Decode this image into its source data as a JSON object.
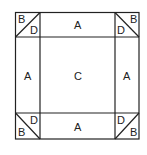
{
  "diagram": {
    "regions": {
      "top_left_corner": {
        "upper": "B",
        "lower": "D"
      },
      "top_edge": "A",
      "top_right_corner": {
        "upper": "B",
        "lower": "D"
      },
      "left_edge": "A",
      "center": "C",
      "right_edge": "A",
      "bottom_left_corner": {
        "upper": "D",
        "lower": "B"
      },
      "bottom_edge": "A",
      "bottom_right_corner": {
        "upper": "D",
        "lower": "B"
      }
    },
    "stroke_color": "#222222"
  }
}
